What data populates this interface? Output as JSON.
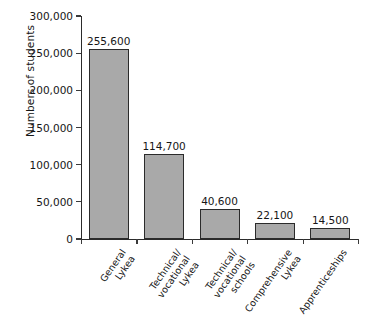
{
  "chart_data": {
    "type": "bar",
    "title": "",
    "xlabel": "",
    "ylabel": "Numbers of students",
    "ylim": [
      0,
      300000
    ],
    "grid": false,
    "legend": "none",
    "categories": [
      "General Lykea",
      "Technical/ vocational Lykea",
      "Technical/ vocational schools",
      "Comprehensive Lykea",
      "Apprenticeships"
    ],
    "category_lines": [
      [
        "General",
        "Lykea"
      ],
      [
        "Technical/",
        "vocational",
        "Lykea"
      ],
      [
        "Technical/",
        "vocational",
        "schools"
      ],
      [
        "Comprehensive",
        "Lykea"
      ],
      [
        "Apprenticeships"
      ]
    ],
    "values": [
      255600,
      114700,
      40600,
      22100,
      14500
    ],
    "value_labels": [
      "255,600",
      "114,700",
      "40,600",
      "22,100",
      "14,500"
    ],
    "ytick_values": [
      0,
      50000,
      100000,
      150000,
      200000,
      250000,
      300000
    ],
    "ytick_labels": [
      "0",
      "50,000",
      "100,000",
      "150,000",
      "200,000",
      "250,000",
      "300,000"
    ],
    "colors": {
      "bar_fill": "#a9a9a9",
      "bar_stroke": "#2b2b2b",
      "axis": "#2b2b2b",
      "text": "#161616",
      "background": "#ffffff"
    }
  }
}
